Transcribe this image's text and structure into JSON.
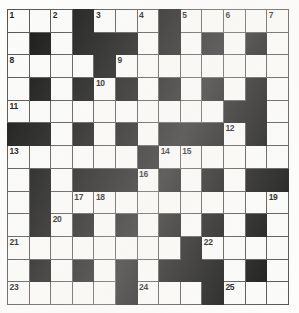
{
  "puzzle": {
    "type": "crossword-grid",
    "rows": 13,
    "columns": 13,
    "cell_size_px": 21.6,
    "colors": {
      "block_fill": "#131313",
      "cell_fill": "#fbfbf9",
      "grid_line": "#55514e",
      "number_text": "#111111",
      "page_background": "#ffffff"
    },
    "total_clue_numbers": 25,
    "grid": [
      [
        "w1",
        "w",
        "w2",
        "b",
        "w3",
        "w",
        "w4",
        "b",
        "w5",
        "w",
        "w6",
        "w",
        "w7"
      ],
      [
        "w",
        "b",
        "w",
        "b",
        "b",
        "b",
        "w",
        "b",
        "w",
        "b",
        "w",
        "b",
        "w"
      ],
      [
        "w8",
        "w",
        "w",
        "w",
        "b",
        "w9",
        "w",
        "w",
        "w",
        "w",
        "w",
        "w",
        "w"
      ],
      [
        "w",
        "b",
        "w",
        "b",
        "w10",
        "b",
        "w",
        "b",
        "w",
        "b",
        "w",
        "b",
        "w"
      ],
      [
        "w11",
        "w",
        "w",
        "w",
        "w",
        "w",
        "w",
        "w",
        "w",
        "w",
        "b",
        "b",
        "w"
      ],
      [
        "b",
        "b",
        "w",
        "b",
        "w",
        "b",
        "w",
        "b",
        "b",
        "b",
        "w12",
        "b",
        "w"
      ],
      [
        "w13",
        "w",
        "w",
        "w",
        "w",
        "w",
        "b",
        "w14",
        "w15",
        "w",
        "w",
        "w",
        "w"
      ],
      [
        "w",
        "b",
        "w",
        "b",
        "b",
        "b",
        "w16",
        "b",
        "w",
        "b",
        "w",
        "b",
        "b"
      ],
      [
        "w",
        "b",
        "w",
        "w17",
        "w18",
        "w",
        "w",
        "w",
        "w",
        "w",
        "w",
        "w",
        "w19"
      ],
      [
        "w",
        "b",
        "w20",
        "b",
        "w",
        "b",
        "w",
        "b",
        "w",
        "b",
        "w",
        "b",
        "w"
      ],
      [
        "w21",
        "w",
        "w",
        "w",
        "w",
        "w",
        "w",
        "w",
        "b",
        "w22",
        "w",
        "w",
        "w"
      ],
      [
        "w",
        "b",
        "w",
        "b",
        "w",
        "b",
        "w",
        "b",
        "b",
        "b",
        "w",
        "b",
        "w"
      ],
      [
        "w23",
        "w",
        "w",
        "w",
        "w",
        "b",
        "w24",
        "w",
        "w",
        "b",
        "w25",
        "w",
        "w"
      ]
    ],
    "numbers": [
      {
        "n": 1,
        "row": 1,
        "col": 1
      },
      {
        "n": 2,
        "row": 1,
        "col": 3
      },
      {
        "n": 3,
        "row": 1,
        "col": 5
      },
      {
        "n": 4,
        "row": 1,
        "col": 7
      },
      {
        "n": 5,
        "row": 1,
        "col": 9
      },
      {
        "n": 6,
        "row": 1,
        "col": 11
      },
      {
        "n": 7,
        "row": 1,
        "col": 13
      },
      {
        "n": 8,
        "row": 3,
        "col": 1
      },
      {
        "n": 9,
        "row": 3,
        "col": 6
      },
      {
        "n": 10,
        "row": 4,
        "col": 5
      },
      {
        "n": 11,
        "row": 5,
        "col": 1
      },
      {
        "n": 12,
        "row": 6,
        "col": 11
      },
      {
        "n": 13,
        "row": 7,
        "col": 1
      },
      {
        "n": 14,
        "row": 7,
        "col": 8
      },
      {
        "n": 15,
        "row": 7,
        "col": 9
      },
      {
        "n": 16,
        "row": 8,
        "col": 7
      },
      {
        "n": 17,
        "row": 9,
        "col": 4
      },
      {
        "n": 18,
        "row": 9,
        "col": 5
      },
      {
        "n": 19,
        "row": 9,
        "col": 13
      },
      {
        "n": 20,
        "row": 10,
        "col": 3
      },
      {
        "n": 21,
        "row": 11,
        "col": 1
      },
      {
        "n": 22,
        "row": 11,
        "col": 10
      },
      {
        "n": 23,
        "row": 13,
        "col": 1
      },
      {
        "n": 24,
        "row": 13,
        "col": 7
      },
      {
        "n": 25,
        "row": 13,
        "col": 11
      }
    ]
  }
}
